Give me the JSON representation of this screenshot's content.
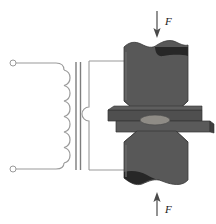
{
  "figure": {
    "name": "resistance-spot-welding-diagram",
    "width": 216,
    "height": 224,
    "background_color": "#ffffff"
  },
  "colors": {
    "electrode_body": "#585858",
    "electrode_shadow": "#2d2d2d",
    "sheet_upper": "#4f4f4f",
    "sheet_lower": "#5c5c5c",
    "weld_nugget": "#8f8c86",
    "wire": "#9a9a9a",
    "core": "#8a8a8a",
    "arrow": "#4a4a4a",
    "label_text": "#1a1a1a",
    "outline": "#3a3a3a"
  },
  "transformer": {
    "primary": {
      "name": "primary-winding",
      "turns": 6,
      "terminals": [
        {
          "name": "primary-terminal-top",
          "cx": 13,
          "cy": 63,
          "r": 3
        },
        {
          "name": "primary-terminal-bottom",
          "cx": 13,
          "cy": 169,
          "r": 3
        }
      ],
      "lead_top_y": 63,
      "lead_bottom_y": 169,
      "coil_x": 64,
      "coil_top_y": 70,
      "coil_bottom_y": 163,
      "loop_radius": 8
    },
    "core": {
      "name": "transformer-core",
      "lines": [
        {
          "x": 76,
          "y1": 62,
          "y2": 170
        },
        {
          "x": 80,
          "y1": 62,
          "y2": 170
        }
      ]
    },
    "secondary": {
      "name": "secondary-winding",
      "turns": 1,
      "loop_left_x": 89,
      "loop_top_y": 58,
      "loop_bottom_y": 172,
      "bump_center_y": 114,
      "bump_radius": 7
    }
  },
  "electrodes": {
    "upper": {
      "name": "upper-electrode",
      "label": "upper electrode",
      "top_y": 41,
      "bottom_y": 110,
      "left_x": 124,
      "right_x": 188,
      "taper_left_x": 136,
      "taper_right_x": 176
    },
    "lower": {
      "name": "lower-electrode",
      "label": "lower electrode",
      "top_y": 133,
      "bottom_y": 190,
      "left_x": 124,
      "right_x": 188,
      "taper_left_x": 136,
      "taper_right_x": 176
    }
  },
  "workpiece": {
    "upper_sheet": {
      "name": "upper-workpiece-sheet",
      "x": 108,
      "y": 108,
      "width": 94,
      "height": 12
    },
    "lower_sheet": {
      "name": "lower-workpiece-sheet",
      "x": 118,
      "y": 119,
      "width": 94,
      "height": 13
    },
    "weld_nugget": {
      "name": "weld-nugget",
      "cx": 155,
      "cy": 120,
      "rx": 15,
      "ry": 5
    }
  },
  "forces": [
    {
      "name": "force-arrow-top",
      "label": "F",
      "direction": "down",
      "x": 157,
      "y_start": 11,
      "y_end": 38,
      "label_x": 164,
      "label_y": 22
    },
    {
      "name": "force-arrow-bottom",
      "label": "F",
      "direction": "up",
      "x": 157,
      "y_start": 216,
      "y_end": 192,
      "label_x": 164,
      "label_y": 211
    }
  ],
  "secondary_circuit": {
    "name": "secondary-circuit-wires",
    "upper_connection_y": 61,
    "lower_connection_y": 170,
    "right_x": 140
  }
}
